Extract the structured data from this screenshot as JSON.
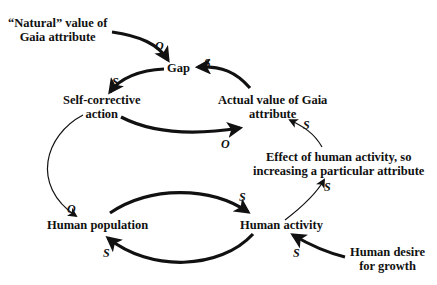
{
  "diagram": {
    "type": "causal-loop",
    "nodes": {
      "natural_value": {
        "line1": "“Natural” value of",
        "line2": "Gaia attribute"
      },
      "gap": {
        "label": "Gap"
      },
      "self_corrective": {
        "line1": "Self-corrective",
        "line2": "action"
      },
      "actual_value": {
        "line1": "Actual value of Gaia",
        "line2": "attribute"
      },
      "effect": {
        "line1": "Effect of human activity, so",
        "line2": "increasing a particular attribute"
      },
      "population": {
        "label": "Human population"
      },
      "activity": {
        "label": "Human activity"
      },
      "desire": {
        "line1": "Human desire",
        "line2": "for growth"
      }
    },
    "links": [
      {
        "from": "natural_value",
        "to": "gap",
        "polarity": "O"
      },
      {
        "from": "actual_value",
        "to": "gap",
        "polarity": "S"
      },
      {
        "from": "gap",
        "to": "self_corrective",
        "polarity": "S"
      },
      {
        "from": "self_corrective",
        "to": "actual_value",
        "polarity": "O"
      },
      {
        "from": "self_corrective",
        "to": "population",
        "polarity": "O"
      },
      {
        "from": "population",
        "to": "activity",
        "polarity": "S"
      },
      {
        "from": "activity",
        "to": "population",
        "polarity": "S"
      },
      {
        "from": "activity",
        "to": "effect",
        "polarity": "S"
      },
      {
        "from": "effect",
        "to": "actual_value",
        "polarity": "S"
      },
      {
        "from": "desire",
        "to": "activity",
        "polarity": "S"
      }
    ]
  }
}
